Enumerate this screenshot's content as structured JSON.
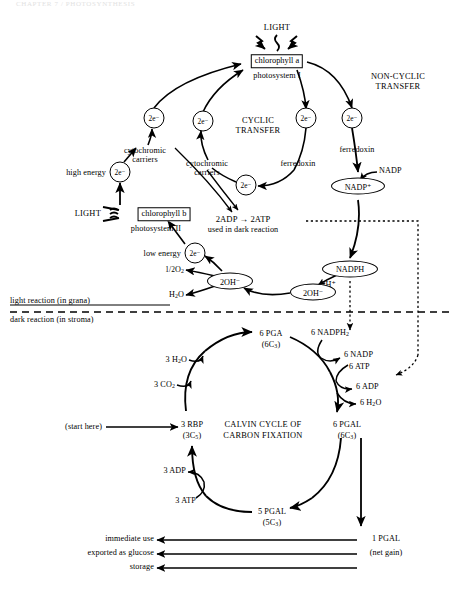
{
  "page": {
    "faint_header": "CHAPTER 7 / PHOTOSYNTHESIS"
  },
  "light_reaction": {
    "light_top_label": "LIGHT",
    "chlorophyll_a_box": "chlorophyll a",
    "photosystem_I_label": "photosystem I",
    "noncyclic_transfer_line1": "NON-CYCLIC",
    "noncyclic_transfer_line2": "TRANSFER",
    "cyclic_transfer_line1": "CYCLIC",
    "cyclic_transfer_line2": "TRANSFER",
    "electron_label": "2e⁻",
    "cytochromic_carriers_upper_line1": "cytochromic",
    "cytochromic_carriers_upper_line2": "carriers",
    "cytochromic_carriers_mid_line1": "cytochromic",
    "cytochromic_carriers_mid_line2": "carriers",
    "ferredoxin_cyclic": "ferredoxin",
    "ferredoxin_noncyclic": "ferredoxin",
    "nadp_label": "NADP",
    "nadp_plus_oval": "NADP⁺",
    "nadph_oval": "NADPH",
    "two_h_plus": "2H⁺",
    "high_energy_label": "high energy",
    "low_energy_label": "low energy",
    "light_left_label": "LIGHT",
    "chlorophyll_b_box": "chlorophyll b",
    "photosystem_II_label": "photosystem II",
    "adp_atp_line": "2ADP → 2ATP",
    "used_in_dark_reaction": "used in dark reaction",
    "oh_inner": "2OH⁻",
    "oh_outer": "2OH⁻",
    "half_o2_num": "1",
    "half_o2_den": "2",
    "half_o2_species": "O",
    "half_o2_sub": "2",
    "water_label_main": "H",
    "water_label_sub": "2",
    "water_label_tail": "O"
  },
  "divider": {
    "light_reaction_label": "light reaction (in grana)",
    "dark_reaction_label": "dark reaction (in stroma)"
  },
  "calvin_cycle": {
    "title_line1": "CALVIN CYCLE OF",
    "title_line2": "CARBON FIXATION",
    "start_here": "(start here)",
    "rbp_name": "3 RBP",
    "rbp_formula": "(3C",
    "rbp_formula_sub": "5",
    "rbp_formula_end": ")",
    "co2_label": "3 CO",
    "co2_sub": "2",
    "h2o_label": "3 H",
    "h2o_sub": "2",
    "h2o_end": "O",
    "pga_name": "6 PGA",
    "pga_formula": "(6C",
    "pga_formula_sub": "3",
    "pga_formula_end": ")",
    "nadph2_label": "6 NADPH",
    "nadph2_sub": "2",
    "nadp_out": "6 NADP",
    "atp_in": "6 ATP",
    "adp_out": "6 ADP",
    "h2o_out": "6 H",
    "h2o_out_sub": "2",
    "h2o_out_end": "O",
    "pgal6_name": "6 PGAL",
    "pgal6_formula": "(6C",
    "pgal6_formula_sub": "3",
    "pgal6_formula_end": ")",
    "pgal5_name": "5 PGAL",
    "pgal5_formula": "(5C",
    "pgal5_formula_sub": "3",
    "pgal5_formula_end": ")",
    "atp3_label": "3 ATP",
    "adp3_label": "3 ADP",
    "pgal1_name": "1 PGAL",
    "pgal1_note": "(net gain)",
    "output_immediate": "immediate use",
    "output_glucose": "exported as glucose",
    "output_storage": "storage"
  },
  "colors": {
    "ink": "#000000",
    "paper": "#ffffff",
    "faint": "#e2e2e2"
  }
}
